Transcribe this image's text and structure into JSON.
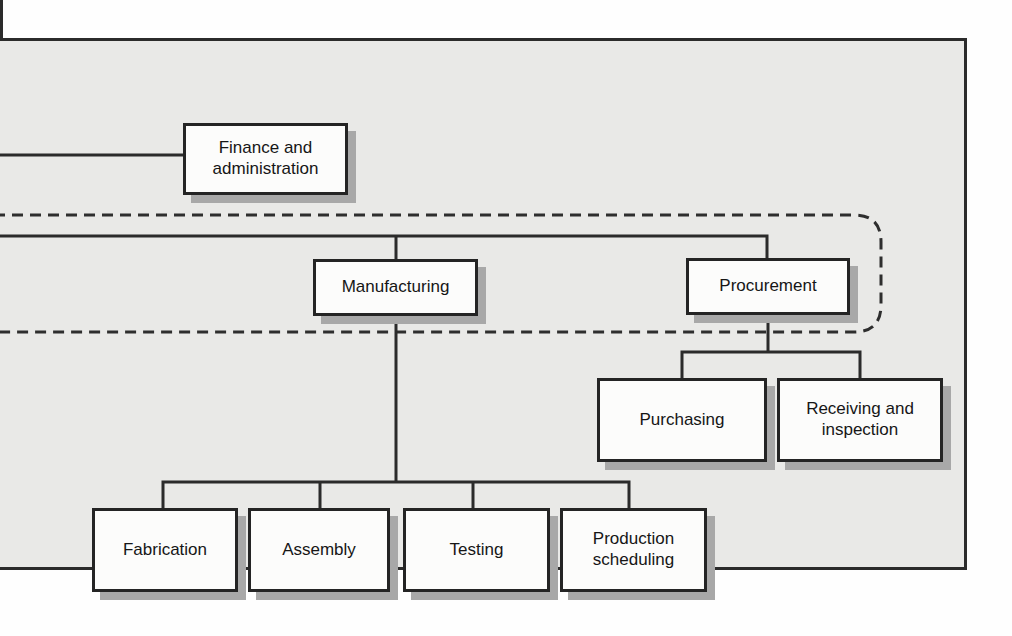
{
  "diagram": {
    "type": "org-chart",
    "note_left_edge": "chart is cropped at left; parent connectors run off-screen",
    "colors": {
      "panel_background": "#e9e9e7",
      "page_background": "#fefefe",
      "line": "#2b2b2b",
      "box_fill": "#fcfcfb",
      "box_border": "#242424",
      "box_shadow": "#a8a8a8"
    },
    "dashed_group": {
      "style": "dashed rounded outline",
      "encloses": [
        "Manufacturing",
        "Procurement"
      ]
    },
    "nodes": [
      {
        "id": "finance",
        "label": "Finance and administration"
      },
      {
        "id": "manufacturing",
        "label": "Manufacturing"
      },
      {
        "id": "procurement",
        "label": "Procurement"
      },
      {
        "id": "purchasing",
        "label": "Purchasing"
      },
      {
        "id": "receiving",
        "label": "Receiving and inspection"
      },
      {
        "id": "fabrication",
        "label": "Fabrication"
      },
      {
        "id": "assembly",
        "label": "Assembly"
      },
      {
        "id": "testing",
        "label": "Testing"
      },
      {
        "id": "production_scheduling",
        "label": "Production scheduling"
      }
    ],
    "edges": [
      {
        "from": "off-screen-left",
        "to": "finance"
      },
      {
        "from": "off-screen-left",
        "to": "manufacturing"
      },
      {
        "from": "off-screen-left",
        "to": "procurement"
      },
      {
        "from": "manufacturing",
        "to": "fabrication"
      },
      {
        "from": "manufacturing",
        "to": "assembly"
      },
      {
        "from": "manufacturing",
        "to": "testing"
      },
      {
        "from": "manufacturing",
        "to": "production_scheduling"
      },
      {
        "from": "procurement",
        "to": "purchasing"
      },
      {
        "from": "procurement",
        "to": "receiving"
      }
    ]
  }
}
